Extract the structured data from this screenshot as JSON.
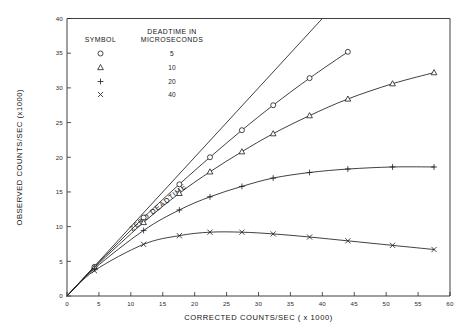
{
  "chart_data": {
    "type": "line",
    "title": "",
    "xlabel": "CORRECTED COUNTS/SEC ( x 1000)",
    "ylabel": "OBSERVED COUNTS/SEC (x1000)",
    "xlim": [
      0,
      60
    ],
    "ylim": [
      0,
      40
    ],
    "xticks": [
      0,
      5,
      10,
      15,
      20,
      25,
      30,
      35,
      40,
      45,
      50,
      55,
      60
    ],
    "yticks": [
      0,
      5,
      10,
      15,
      20,
      25,
      30,
      35,
      40
    ],
    "grid": false,
    "legend_position": "upper-left-inside",
    "annotations": [
      {
        "text": "ZERO DEADTIME",
        "rotation": -39,
        "x_data": 14.5,
        "y_data": 12.5
      }
    ],
    "reference_line": {
      "name": "ZERO DEADTIME",
      "description": "observed = corrected (1:1 line)",
      "x": [
        0,
        40
      ],
      "y": [
        0,
        40
      ]
    },
    "series": [
      {
        "name": "5",
        "symbol": "circle",
        "deadtime_microseconds": 5,
        "x": [
          0,
          4.3,
          12.0,
          17.6,
          22.4,
          27.4,
          32.3,
          38.0,
          44.0
        ],
        "y": [
          0,
          4.2,
          11.3,
          16.1,
          20.0,
          23.9,
          27.5,
          31.4,
          35.2
        ]
      },
      {
        "name": "10",
        "symbol": "triangle",
        "deadtime_microseconds": 10,
        "x": [
          0,
          4.3,
          12.0,
          17.6,
          22.4,
          27.4,
          32.3,
          38.0,
          44.0,
          51.0,
          57.5
        ],
        "y": [
          0,
          4.1,
          10.6,
          14.8,
          17.9,
          20.8,
          23.4,
          26.0,
          28.4,
          30.6,
          32.2
        ]
      },
      {
        "name": "20",
        "symbol": "plus",
        "deadtime_microseconds": 20,
        "x": [
          0,
          4.3,
          12.0,
          17.6,
          22.4,
          27.4,
          32.3,
          38.0,
          44.0,
          51.0,
          57.5
        ],
        "y": [
          0,
          3.95,
          9.45,
          12.4,
          14.3,
          15.8,
          17.0,
          17.8,
          18.3,
          18.6,
          18.6
        ]
      },
      {
        "name": "40",
        "symbol": "cross",
        "deadtime_microseconds": 40,
        "x": [
          0,
          4.3,
          12.0,
          17.6,
          22.4,
          27.4,
          32.3,
          38.0,
          44.0,
          51.0,
          57.5
        ],
        "y": [
          0,
          3.65,
          7.45,
          8.7,
          9.2,
          9.2,
          8.95,
          8.5,
          7.95,
          7.3,
          6.7
        ]
      }
    ]
  },
  "legend": {
    "header_symbol": "SYMBOL",
    "header_value_line1": "DEADTIME IN",
    "header_value_line2": "MICROSECONDS",
    "rows": [
      {
        "symbol": "circle",
        "value": "5"
      },
      {
        "symbol": "triangle",
        "value": "10"
      },
      {
        "symbol": "plus",
        "value": "20"
      },
      {
        "symbol": "cross",
        "value": "40"
      }
    ]
  }
}
